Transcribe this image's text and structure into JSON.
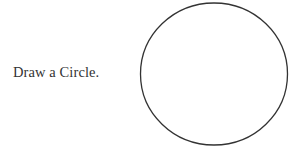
{
  "prompt": {
    "text": "Draw a Circle."
  },
  "circle": {
    "cx": 214,
    "cy": 74,
    "rx": 73.5,
    "ry": 71,
    "stroke": "#333333",
    "stroke_width": 1.3
  }
}
